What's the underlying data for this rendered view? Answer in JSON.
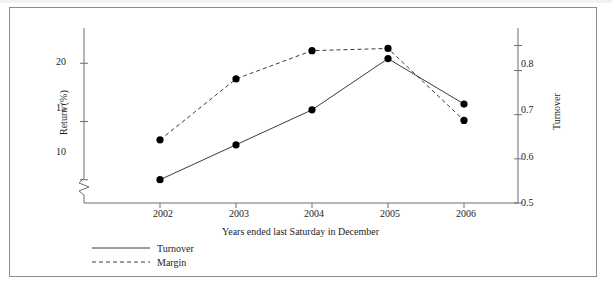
{
  "figure": {
    "frame_color": "#8d8d8d",
    "background": "#ffffff"
  },
  "chart_data": {
    "type": "line",
    "title": "",
    "subtitle": "",
    "xlabel": "Years ended last Saturday in December",
    "categories": [
      "2002",
      "2003",
      "2004",
      "2005",
      "2006"
    ],
    "x": [
      2002,
      2003,
      2004,
      2005,
      2006
    ],
    "grid": false,
    "legend_position": "below-left",
    "axes": {
      "left": {
        "label": "Return (%)",
        "ticks": [
          "10",
          "15",
          "20"
        ],
        "tick_values": [
          10,
          15,
          20
        ],
        "ylim": [
          8.0,
          22.6
        ],
        "axis_break": true
      },
      "right": {
        "label": "Turnover",
        "ticks": [
          "0.5",
          "0.6",
          "0.7",
          "0.8"
        ],
        "tick_values": [
          0.5,
          0.6,
          0.7,
          0.8
        ],
        "ylim": [
          0.5,
          0.885
        ]
      }
    },
    "series": [
      {
        "name": "Turnover",
        "axis": "left",
        "style": "solid",
        "marker": "filled-circle",
        "values": [
          10.0,
          13.0,
          16.0,
          20.4,
          16.5
        ]
      },
      {
        "name": "Margin",
        "axis": "right",
        "style": "dashed",
        "marker": "filled-circle",
        "values": [
          0.643,
          0.781,
          0.845,
          0.85,
          0.687
        ]
      }
    ]
  },
  "legend": {
    "items": [
      {
        "label": "Turnover",
        "style": "solid"
      },
      {
        "label": "Margin",
        "style": "dashed"
      }
    ]
  }
}
